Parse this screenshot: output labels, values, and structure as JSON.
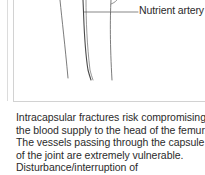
{
  "figure": {
    "labels": {
      "nutrient_artery": "Nutrient artery"
    },
    "colors": {
      "line": "#555555",
      "line_light": "#8a8a8a",
      "border": "#d2d2d2"
    }
  },
  "body": {
    "paragraph": "Intracapsular fractures risk compromising the blood supply to the head of the femur. The vessels passing through the capsule of the joint are extremely vulnerable. Disturbance/interruption of"
  }
}
